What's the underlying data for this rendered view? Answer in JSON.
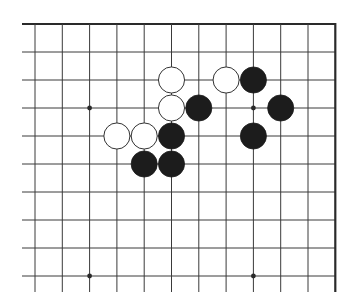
{
  "board": {
    "description": "Go board diagram, upper-right corner region",
    "origin_x": 35,
    "origin_y": 24,
    "step_x": 27.3,
    "step_y": 28,
    "cols": 11,
    "rows": 10,
    "line_extend_left": 13,
    "line_extend_bottom": 16,
    "top_edge": true,
    "right_edge": true,
    "colors": {
      "line": "#3a3a3a",
      "edge": "#2a2a2a",
      "black_stone": "#1c1c1c",
      "white_stone": "#ffffff",
      "white_outline": "#333333",
      "background": "#ffffff"
    },
    "star_points": [
      {
        "col": 2,
        "row": 3
      },
      {
        "col": 8,
        "row": 3
      },
      {
        "col": 2,
        "row": 9
      },
      {
        "col": 8,
        "row": 9
      }
    ],
    "stones": [
      {
        "color": "white",
        "col": 5,
        "row": 2
      },
      {
        "color": "white",
        "col": 7,
        "row": 2
      },
      {
        "color": "black",
        "col": 8,
        "row": 2
      },
      {
        "color": "white",
        "col": 5,
        "row": 3
      },
      {
        "color": "black",
        "col": 6,
        "row": 3
      },
      {
        "color": "black",
        "col": 9,
        "row": 3
      },
      {
        "color": "white",
        "col": 3,
        "row": 4
      },
      {
        "color": "white",
        "col": 4,
        "row": 4
      },
      {
        "color": "black",
        "col": 5,
        "row": 4
      },
      {
        "color": "black",
        "col": 8,
        "row": 4
      },
      {
        "color": "black",
        "col": 4,
        "row": 5
      },
      {
        "color": "black",
        "col": 5,
        "row": 5
      }
    ]
  }
}
